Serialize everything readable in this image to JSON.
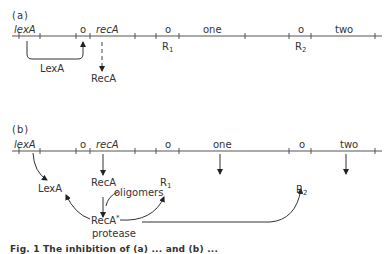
{
  "panel_a": {
    "label": "(a)",
    "genes": {
      "lexA": "lexA",
      "o1": "o",
      "recA": "recA",
      "o2": "o",
      "one": "one",
      "o3": "o",
      "two": "two"
    },
    "repressors": {
      "R1": "R",
      "R1_sub": "1",
      "R2": "R",
      "R2_sub": "2"
    },
    "products": {
      "lexA_protein": "LexA",
      "recA_protein": "RecA"
    }
  },
  "panel_b": {
    "label": "(b)",
    "genes": {
      "lexA": "lexA",
      "o1": "o",
      "recA": "recA",
      "o2": "o",
      "one": "one",
      "o3": "o",
      "two": "two"
    },
    "products": {
      "lexA_protein": "LexA",
      "recA_protein": "RecA",
      "R1": "R",
      "R1_sub": "1",
      "R2": "R",
      "R2_sub": "2",
      "recA_star": "RecA",
      "recA_star_sup": "*",
      "protease": "protease",
      "oligomers": "oligomers"
    }
  },
  "caption": "Fig. 1 The inhibition of (a) ... and (b) ..."
}
